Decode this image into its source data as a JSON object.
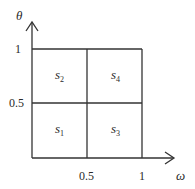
{
  "diagram": {
    "type": "partitioned-unit-square",
    "axes": {
      "x": {
        "label": "ω",
        "ticks": [
          "0.5",
          "1"
        ]
      },
      "y": {
        "label": "θ",
        "ticks": [
          "0.5",
          "1"
        ]
      },
      "origin": "0"
    },
    "regions": [
      {
        "name": "s",
        "sub": "1",
        "position": "bottom-left"
      },
      {
        "name": "s",
        "sub": "2",
        "position": "top-left"
      },
      {
        "name": "s",
        "sub": "3",
        "position": "bottom-right"
      },
      {
        "name": "s",
        "sub": "4",
        "position": "top-right"
      }
    ],
    "line_color": "#333333"
  }
}
